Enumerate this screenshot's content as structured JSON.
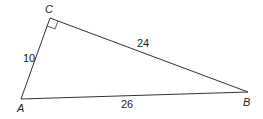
{
  "diagram": {
    "type": "right-triangle",
    "vertices": {
      "A": {
        "label": "A"
      },
      "B": {
        "label": "B"
      },
      "C": {
        "label": "C",
        "right_angle": true
      }
    },
    "sides": {
      "AC": "10",
      "CB": "24",
      "AB": "26"
    },
    "line_color": "#333333"
  }
}
